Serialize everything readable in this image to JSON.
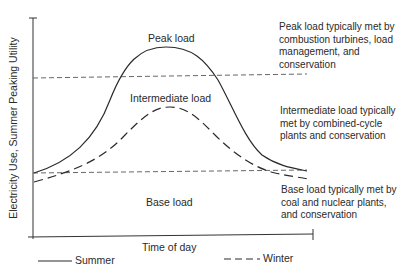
{
  "diagram": {
    "y_axis_label": "Electricity Use, Summer Peaking Utility",
    "x_axis_label": "Time of day",
    "regions": {
      "peak": "Peak load",
      "intermediate": "Intermediate load",
      "base": "Base load"
    },
    "annotations": {
      "peak": "Peak load typically met by\ncombustion turbines, load\nmanagement, and\nconservation",
      "intermediate": "Intermediate load typically\nmet by combined-cycle\nplants and conservation",
      "base": "Base load typically met by\ncoal and nuclear plants,\nand conservation"
    },
    "legend": [
      {
        "label": "Summer",
        "style": "solid"
      },
      {
        "label": "Winter",
        "style": "dashed"
      }
    ],
    "colors": {
      "line": "#2a2a2a",
      "threshold": "#555555",
      "background": "#ffffff"
    }
  }
}
